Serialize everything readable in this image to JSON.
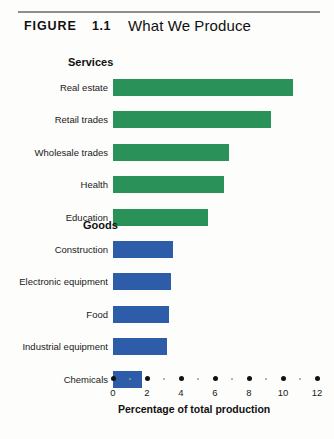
{
  "header": {
    "figure_label": "FIGURE",
    "figure_number": "1.1",
    "title": "What We Produce"
  },
  "chart_data": {
    "type": "bar",
    "orientation": "horizontal",
    "title": "What We Produce",
    "xlabel": "Percentage of total production",
    "ylabel": "",
    "xlim": [
      0,
      12
    ],
    "xticks": [
      0,
      2,
      4,
      6,
      8,
      10,
      12
    ],
    "xticklabels": [
      "0",
      "2",
      "4",
      "6",
      "8",
      "10",
      "12"
    ],
    "minor_ticks": [
      1,
      3,
      5,
      7,
      9,
      11
    ],
    "grid": false,
    "legend": false,
    "groups": [
      {
        "name": "Services",
        "color": "#2a9159",
        "categories": [
          "Real estate",
          "Retail trades",
          "Wholesale trades",
          "Health",
          "Education"
        ],
        "values": [
          10.6,
          9.3,
          6.8,
          6.5,
          5.6
        ]
      },
      {
        "name": "Goods",
        "color": "#2d5da9",
        "categories": [
          "Construction",
          "Electronic equipment",
          "Food",
          "Industrial equipment",
          "Chemicals"
        ],
        "values": [
          3.5,
          3.4,
          3.3,
          3.2,
          1.7
        ]
      }
    ]
  },
  "colors": {
    "services": "#2a9159",
    "goods": "#2d5da9",
    "rule": "#8e8e8e",
    "background": "#fdfdfb",
    "text": "#111111"
  }
}
